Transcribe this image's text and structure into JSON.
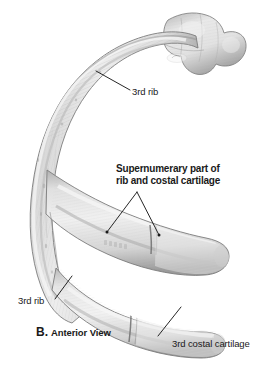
{
  "figure": {
    "caption_letter": "B.",
    "caption_text": "Anterior View",
    "background_color": "#ffffff",
    "bone_fill_color": "#dcdcdc",
    "bone_edge_color": "#8a8a8a",
    "leader_line_color": "#1a1a1a",
    "text_color": "#1a1a1a"
  },
  "labels": {
    "rib_upper": "3rd rib",
    "rib_lower": "3rd rib",
    "supernumerary_line1": "Supernumerary part of",
    "supernumerary_line2": "rib and costal cartilage",
    "costal_cartilage": "3rd costal cartilage"
  }
}
